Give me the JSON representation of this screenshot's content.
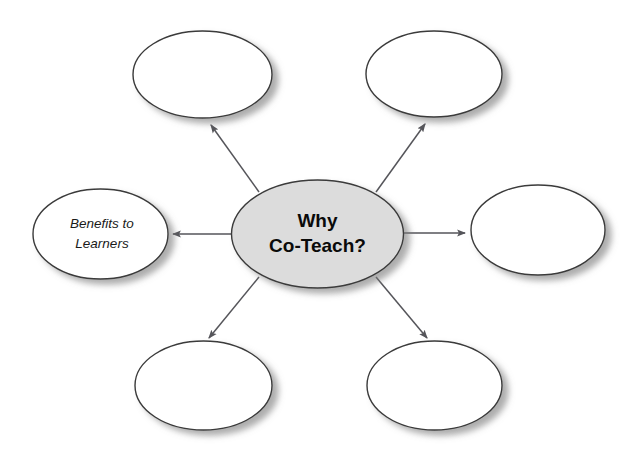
{
  "diagram": {
    "type": "concept-map-spider",
    "title": "Why Co-Teach?",
    "canvas": {
      "width": 638,
      "height": 457,
      "background": "#ffffff"
    },
    "center_node": {
      "id": "center",
      "text_line1": "Why",
      "text_line2": "Co-Teach?",
      "full_text": "Why Co-Teach?",
      "fill": "#dcdcdc",
      "stroke": "#3a3a3a",
      "cx": 317.5,
      "cy": 234,
      "rx": 86,
      "ry": 54,
      "font_style": "bold"
    },
    "outer_nodes": [
      {
        "id": "top-left",
        "position": "top-left",
        "text": "",
        "fill": "#ffffff",
        "stroke": "#3a3a3a",
        "cx": 202.5,
        "cy": 74.5,
        "rx": 69.5,
        "ry": 43.5,
        "font_style": "italic"
      },
      {
        "id": "top-right",
        "position": "top-right",
        "text": "",
        "fill": "#ffffff",
        "stroke": "#3a3a3a",
        "cx": 434,
        "cy": 74,
        "rx": 68,
        "ry": 43,
        "font_style": "italic"
      },
      {
        "id": "left",
        "position": "left",
        "text_line1": "Benefits to",
        "text_line2": "Learners",
        "text": "Benefits to Learners",
        "fill": "#ffffff",
        "stroke": "#3a3a3a",
        "cx": 100.5,
        "cy": 234,
        "rx": 67.5,
        "ry": 45,
        "font_style": "italic"
      },
      {
        "id": "right",
        "position": "right",
        "text": "",
        "fill": "#ffffff",
        "stroke": "#3a3a3a",
        "cx": 538,
        "cy": 230,
        "rx": 67,
        "ry": 45,
        "font_style": "italic"
      },
      {
        "id": "bottom-left",
        "position": "bottom-left",
        "text": "",
        "fill": "#ffffff",
        "stroke": "#3a3a3a",
        "cx": 203.5,
        "cy": 385.5,
        "rx": 68.5,
        "ry": 44.5,
        "font_style": "italic"
      },
      {
        "id": "bottom-right",
        "position": "bottom-right",
        "text": "",
        "fill": "#ffffff",
        "stroke": "#3a3a3a",
        "cx": 434.5,
        "cy": 385.5,
        "rx": 67.5,
        "ry": 44.5,
        "font_style": "italic"
      }
    ],
    "connectors": [
      {
        "id": "arrow-to-top-left",
        "from": "center",
        "to": "top-left",
        "x1": 259,
        "y1": 192,
        "x2": 211,
        "y2": 125,
        "direction": "up-left"
      },
      {
        "id": "arrow-to-top-right",
        "from": "center",
        "to": "top-right",
        "x1": 376,
        "y1": 192,
        "x2": 425,
        "y2": 124,
        "direction": "up-right"
      },
      {
        "id": "arrow-to-left",
        "from": "center",
        "to": "left",
        "x1": 231,
        "y1": 234,
        "x2": 173,
        "y2": 234,
        "direction": "left"
      },
      {
        "id": "arrow-to-right",
        "from": "center",
        "to": "right",
        "x1": 404,
        "y1": 233,
        "x2": 465,
        "y2": 233,
        "direction": "right"
      },
      {
        "id": "arrow-to-bottom-left",
        "from": "center",
        "to": "bottom-left",
        "x1": 259,
        "y1": 277,
        "x2": 209,
        "y2": 338,
        "direction": "down-left"
      },
      {
        "id": "arrow-to-bottom-right",
        "from": "center",
        "to": "bottom-right",
        "x1": 376,
        "y1": 277,
        "x2": 427,
        "y2": 338,
        "direction": "down-right"
      }
    ],
    "colors": {
      "center_fill": "#dcdcdc",
      "outer_fill": "#ffffff",
      "outline": "#3a3a3a",
      "connector": "#55555a",
      "text": "#0a0a0a",
      "background": "#ffffff"
    }
  }
}
